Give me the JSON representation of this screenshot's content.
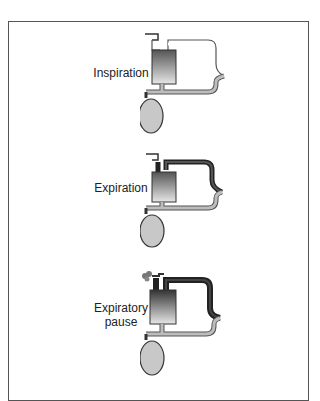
{
  "header": {
    "cut_off_text": ""
  },
  "figure": {
    "panels": [
      {
        "label": "Inspiration",
        "phase": "inspiration",
        "icon": "ventilator-inspiration-diagram"
      },
      {
        "label": "Expiration",
        "phase": "expiration",
        "icon": "ventilator-expiration-diagram"
      },
      {
        "label_line1": "Expiratory",
        "label_line2": "pause",
        "phase": "expiratory-pause",
        "icon": "ventilator-expiratory-pause-diagram"
      }
    ],
    "colors": {
      "frame": "#555555",
      "tube_light": "#bdbdbd",
      "tube_dark": "#333333",
      "bag": "#c8c8c8",
      "cylinder_top": "#555555",
      "cylinder_bottom": "#e0e0e0"
    }
  }
}
